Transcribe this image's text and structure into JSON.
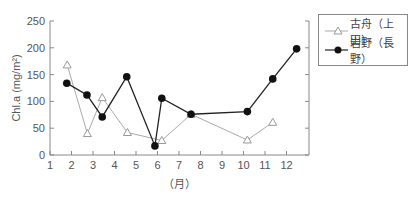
{
  "chart_data": {
    "type": "line",
    "title": "",
    "xlabel": "（月）",
    "ylabel": "Chl.a (mg/m²)",
    "xlim": [
      1,
      13
    ],
    "ylim": [
      0,
      250
    ],
    "x_ticks": [
      "1",
      "2",
      "3",
      "4",
      "5",
      "6",
      "7",
      "8",
      "9",
      "10",
      "11",
      "12"
    ],
    "y_ticks": [
      "0",
      "50",
      "100",
      "150",
      "200",
      "250"
    ],
    "grid": false,
    "legend_position": "right",
    "series": [
      {
        "name": "古舟（上田）",
        "marker": "open-triangle",
        "color": "#aaaaaa",
        "x": [
          1.8,
          2.74,
          3.43,
          4.6,
          6.2,
          7.56,
          10.18,
          11.36
        ],
        "values": [
          168,
          40,
          107,
          42,
          27,
          76,
          28,
          61
        ]
      },
      {
        "name": "岩野（長野）",
        "marker": "filled-circle",
        "color": "#222222",
        "x": [
          1.78,
          2.72,
          3.43,
          4.57,
          5.88,
          6.2,
          7.56,
          10.18,
          11.36,
          12.47
        ],
        "values": [
          134,
          112,
          71,
          146,
          17,
          106,
          76,
          81,
          142,
          198
        ]
      }
    ]
  },
  "legend": {
    "items": [
      {
        "label": "古舟（上田）"
      },
      {
        "label": "岩野（長野）"
      }
    ]
  }
}
